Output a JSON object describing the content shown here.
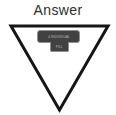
{
  "page": {
    "background_color": "#ffffff"
  },
  "title": {
    "text": "Answer",
    "color": "#2e2e2e"
  },
  "diagram": {
    "triangle": {
      "shape": "inverted-triangle",
      "points": "11,26 108,26 59.5,110",
      "stroke_color": "#161616",
      "stroke_width": "3",
      "fill": "none"
    },
    "badge": {
      "shape": "press-plunger",
      "fill_color": "#414141",
      "border_color": "#8f8f8f",
      "text_color": "#b5b5b5",
      "bar_text": "4-INDIVIDUAL",
      "tab_text": "PILL"
    }
  }
}
